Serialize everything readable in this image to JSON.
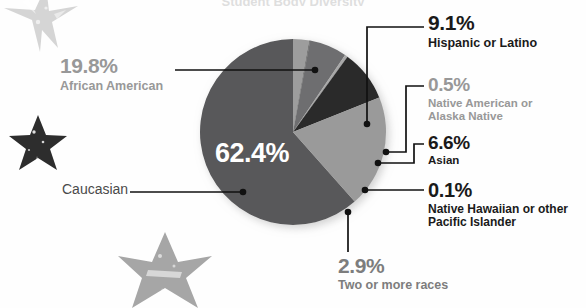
{
  "title_cropped": "Student Body Diversity",
  "colors": {
    "caucasian": "#58585a",
    "african_american": "#9a9a9a",
    "hispanic": "#2b2b2b",
    "native_american": "#a8a8a8",
    "asian": "#6e6e70",
    "native_hawaiian": "#232323",
    "two_or_more": "#9d9d9d",
    "leader_line": "#111111",
    "dark_text": "#1a1a1a",
    "gray_text": "#989898",
    "center_text": "#ffffff",
    "background": "#ffffff",
    "star_light": "#d8d8d8",
    "star_mid": "#a6a6a6",
    "star_dark": "#2d2d2d"
  },
  "chart_data": {
    "type": "pie",
    "title": "Student Body Diversity",
    "xlabel": "",
    "ylabel": "",
    "legend_position": "callout-labels",
    "grid": false,
    "total": 101.4,
    "units": "percent",
    "categories": [
      "Caucasian",
      "African American",
      "Hispanic or Latino",
      "Native American or Alaska Native",
      "Asian",
      "Native Hawaiian or other Pacific Islander",
      "Two or more races"
    ],
    "values": [
      62.4,
      19.8,
      9.1,
      0.5,
      6.6,
      0.1,
      2.9
    ],
    "slices": [
      {
        "label": "Caucasian",
        "value": 62.4,
        "display": "62.4%",
        "color": "#58585a",
        "label_style": "inside-white"
      },
      {
        "label": "African American",
        "value": 19.8,
        "display": "19.8%",
        "color": "#9a9a9a",
        "label_style": "gray"
      },
      {
        "label": "Hispanic or Latino",
        "value": 9.1,
        "display": "9.1%",
        "color": "#2b2b2b",
        "label_style": "dark"
      },
      {
        "label": "Native American or Alaska Native",
        "value": 0.5,
        "display": "0.5%",
        "color": "#a8a8a8",
        "label_style": "gray"
      },
      {
        "label": "Asian",
        "value": 6.6,
        "display": "6.6%",
        "color": "#6e6e70",
        "label_style": "dark"
      },
      {
        "label": "Native Hawaiian or other Pacific Islander",
        "value": 0.1,
        "display": "0.1%",
        "color": "#232323",
        "label_style": "dark"
      },
      {
        "label": "Two or more races",
        "value": 2.9,
        "display": "2.9%",
        "color": "#9d9d9d",
        "label_style": "midgray"
      }
    ]
  },
  "labels": {
    "center": {
      "percent": "62.4%"
    },
    "caucasian": {
      "name": "Caucasian"
    },
    "african_american": {
      "percent": "19.8%",
      "name": "African American"
    },
    "hispanic": {
      "percent": "9.1%",
      "name": "Hispanic or Latino"
    },
    "native_american": {
      "percent": "0.5%",
      "name": "Native American or Alaska Native"
    },
    "asian": {
      "percent": "6.6%",
      "name": "Asian"
    },
    "native_hawaiian": {
      "percent": "0.1%",
      "name": "Native Hawaiian or other Pacific Islander"
    },
    "two_or_more": {
      "percent": "2.9%",
      "name": "Two or more races"
    }
  },
  "decorations": [
    {
      "name": "star-top-left",
      "tone": "light"
    },
    {
      "name": "star-mid-left",
      "tone": "dark"
    },
    {
      "name": "star-bottom-center",
      "tone": "mid"
    }
  ]
}
